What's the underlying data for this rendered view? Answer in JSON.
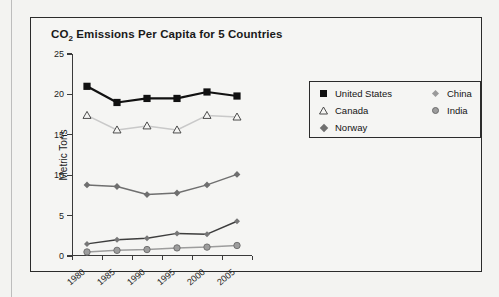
{
  "chart_data": {
    "type": "line",
    "title": "CO2 Emissions Per Capita for 5 Countries",
    "title_main": "CO",
    "title_sub": "2",
    "title_rest": " Emissions Per Capita for 5 Countries",
    "xlabel": "",
    "ylabel": "Metric Tons",
    "categories": [
      "1980",
      "1985",
      "1990",
      "1995",
      "2000",
      "2005"
    ],
    "ylim": [
      0,
      25
    ],
    "yticks": [
      0,
      5,
      10,
      15,
      20,
      25
    ],
    "ytick_labels": [
      "0",
      "5",
      "10",
      "15",
      "20",
      "25"
    ],
    "grid": false,
    "legend_position": "right",
    "series": [
      {
        "name": "United States",
        "marker": "filled-square",
        "color": "#111111",
        "values": [
          21.0,
          19.0,
          19.5,
          19.5,
          20.3,
          19.8
        ]
      },
      {
        "name": "Canada",
        "marker": "open-triangle",
        "color": "#c9c9c9",
        "values": [
          17.4,
          15.6,
          16.1,
          15.6,
          17.4,
          17.2
        ]
      },
      {
        "name": "Norway",
        "marker": "diamond",
        "color": "#6f6f6f",
        "values": [
          8.8,
          8.6,
          7.6,
          7.8,
          8.8,
          10.1
        ]
      },
      {
        "name": "China",
        "marker": "small-diamond",
        "color": "#3d3d3d",
        "values": [
          1.5,
          2.0,
          2.2,
          2.8,
          2.7,
          4.3
        ]
      },
      {
        "name": "India",
        "marker": "circle",
        "color": "#9d9d9d",
        "values": [
          0.5,
          0.7,
          0.8,
          1.0,
          1.1,
          1.3
        ]
      }
    ]
  },
  "legend": {
    "items": [
      {
        "label": "United States",
        "marker": "filled-square"
      },
      {
        "label": "Canada",
        "marker": "open-triangle"
      },
      {
        "label": "Norway",
        "marker": "diamond"
      },
      {
        "label": "China",
        "marker": "small-diamond"
      },
      {
        "label": "India",
        "marker": "circle"
      }
    ]
  }
}
